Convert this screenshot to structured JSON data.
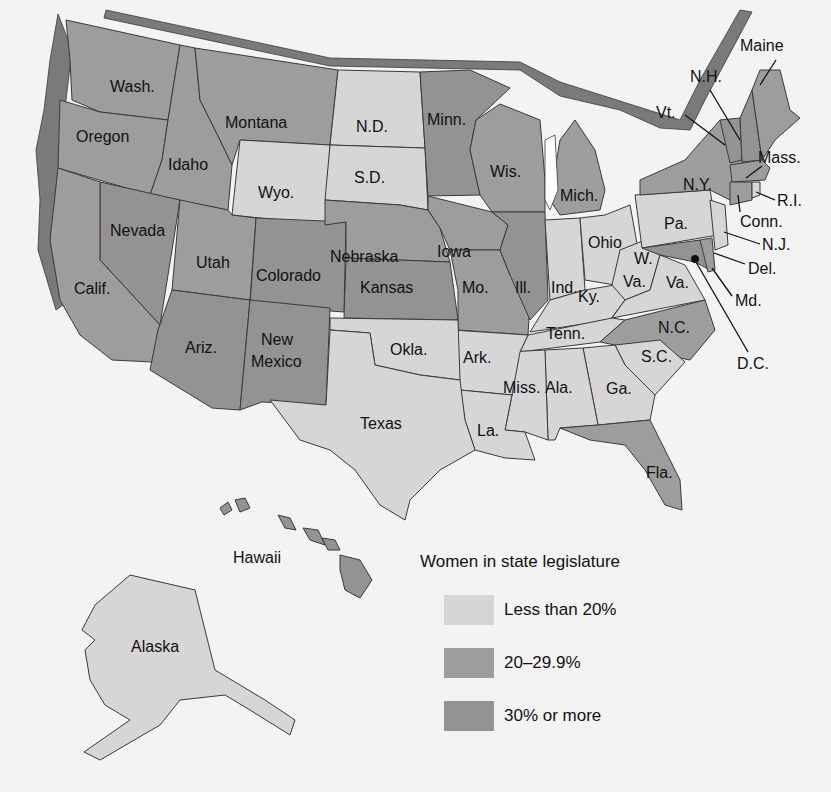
{
  "legend": {
    "title": "Women in state legislature",
    "items": [
      {
        "label": "Less than 20%",
        "color": "#d6d6d6"
      },
      {
        "label": "20–29.9%",
        "color": "#9d9d9d"
      },
      {
        "label": "30% or more",
        "color": "#939393"
      }
    ]
  },
  "colors": {
    "low": "#d6d6d6",
    "mid": "#9d9d9d",
    "high": "#939393",
    "background": "#f3f3f3",
    "border": "#3a3a3a"
  },
  "labels": {
    "wash": "Wash.",
    "oregon": "Oregon",
    "idaho": "Idaho",
    "montana": "Montana",
    "wyo": "Wyo.",
    "nd": "N.D.",
    "sd": "S.D.",
    "minn": "Minn.",
    "wis": "Wis.",
    "mich": "Mich.",
    "nevada": "Nevada",
    "calif": "Calif.",
    "utah": "Utah",
    "colorado": "Colorado",
    "nebraska": "Nebraska",
    "iowa": "Iowa",
    "ill": "Ill.",
    "ind": "Ind.",
    "ohio": "Ohio",
    "kansas": "Kansas",
    "mo": "Mo.",
    "ky": "Ky.",
    "wva1": "W.",
    "wva2": "Va.",
    "va": "Va.",
    "ariz": "Ariz.",
    "nm1": "New",
    "nm2": "Mexico",
    "okla": "Okla.",
    "ark": "Ark.",
    "tenn": "Tenn.",
    "nc": "N.C.",
    "sc": "S.C.",
    "texas": "Texas",
    "miss": "Miss.",
    "ala": "Ala.",
    "ga": "Ga.",
    "la": "La.",
    "fla": "Fla.",
    "pa": "Pa.",
    "ny": "N.Y.",
    "maine": "Maine",
    "nh": "N.H.",
    "vt": "Vt.",
    "mass": "Mass.",
    "ri": "R.I.",
    "conn": "Conn.",
    "nj": "N.J.",
    "del": "Del.",
    "md": "Md.",
    "dc": "D.C.",
    "hawaii": "Hawaii",
    "alaska": "Alaska"
  },
  "states": [
    {
      "name": "Washington",
      "category": "20–29.9%"
    },
    {
      "name": "Oregon",
      "category": "20–29.9%"
    },
    {
      "name": "Idaho",
      "category": "20–29.9%"
    },
    {
      "name": "Montana",
      "category": "20–29.9%"
    },
    {
      "name": "Wyoming",
      "category": "Less than 20%"
    },
    {
      "name": "North Dakota",
      "category": "Less than 20%"
    },
    {
      "name": "South Dakota",
      "category": "Less than 20%"
    },
    {
      "name": "Minnesota",
      "category": "30% or more"
    },
    {
      "name": "Wisconsin",
      "category": "20–29.9%"
    },
    {
      "name": "Michigan",
      "category": "20–29.9%"
    },
    {
      "name": "Nevada",
      "category": "30% or more"
    },
    {
      "name": "California",
      "category": "20–29.9%"
    },
    {
      "name": "Utah",
      "category": "20–29.9%"
    },
    {
      "name": "Colorado",
      "category": "30% or more"
    },
    {
      "name": "Nebraska",
      "category": "20–29.9%"
    },
    {
      "name": "Iowa",
      "category": "20–29.9%"
    },
    {
      "name": "Illinois",
      "category": "30% or more"
    },
    {
      "name": "Indiana",
      "category": "Less than 20%"
    },
    {
      "name": "Ohio",
      "category": "Less than 20%"
    },
    {
      "name": "Kansas",
      "category": "30% or more"
    },
    {
      "name": "Missouri",
      "category": "20–29.9%"
    },
    {
      "name": "Kentucky",
      "category": "Less than 20%"
    },
    {
      "name": "West Virginia",
      "category": "Less than 20%"
    },
    {
      "name": "Virginia",
      "category": "Less than 20%"
    },
    {
      "name": "Arizona",
      "category": "30% or more"
    },
    {
      "name": "New Mexico",
      "category": "30% or more"
    },
    {
      "name": "Oklahoma",
      "category": "Less than 20%"
    },
    {
      "name": "Arkansas",
      "category": "Less than 20%"
    },
    {
      "name": "Tennessee",
      "category": "Less than 20%"
    },
    {
      "name": "North Carolina",
      "category": "20–29.9%"
    },
    {
      "name": "South Carolina",
      "category": "Less than 20%"
    },
    {
      "name": "Texas",
      "category": "Less than 20%"
    },
    {
      "name": "Mississippi",
      "category": "Less than 20%"
    },
    {
      "name": "Alabama",
      "category": "Less than 20%"
    },
    {
      "name": "Georgia",
      "category": "Less than 20%"
    },
    {
      "name": "Louisiana",
      "category": "Less than 20%"
    },
    {
      "name": "Florida",
      "category": "20–29.9%"
    },
    {
      "name": "Pennsylvania",
      "category": "Less than 20%"
    },
    {
      "name": "New York",
      "category": "20–29.9%"
    },
    {
      "name": "Maine",
      "category": "20–29.9%"
    },
    {
      "name": "New Hampshire",
      "category": "30% or more"
    },
    {
      "name": "Vermont",
      "category": "30% or more"
    },
    {
      "name": "Massachusetts",
      "category": "20–29.9%"
    },
    {
      "name": "Rhode Island",
      "category": "Less than 20%"
    },
    {
      "name": "Connecticut",
      "category": "20–29.9%"
    },
    {
      "name": "New Jersey",
      "category": "Less than 20%"
    },
    {
      "name": "Delaware",
      "category": "20–29.9%"
    },
    {
      "name": "Maryland",
      "category": "30% or more"
    },
    {
      "name": "Hawaii",
      "category": "30% or more"
    },
    {
      "name": "Alaska",
      "category": "Less than 20%"
    }
  ]
}
